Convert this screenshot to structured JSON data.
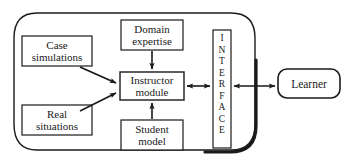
{
  "diagram": {
    "colors": {
      "stroke": "#1a1a1a",
      "box_fill": "#ffffff",
      "background": "#ffffff",
      "text": "#1a1a1a"
    },
    "container": {
      "name": "system-boundary",
      "shape": "rounded-rectangle"
    },
    "nodes": [
      {
        "id": "case-simulations",
        "lines": [
          "Case",
          "simulations"
        ],
        "shape": "rectangle"
      },
      {
        "id": "real-situations",
        "lines": [
          "Real",
          "situations"
        ],
        "shape": "rectangle"
      },
      {
        "id": "domain-expertise",
        "lines": [
          "Domain",
          "expertise"
        ],
        "shape": "rectangle"
      },
      {
        "id": "instructor-module",
        "lines": [
          "Instructor",
          "module"
        ],
        "shape": "rectangle"
      },
      {
        "id": "student-model",
        "lines": [
          "Student",
          "model"
        ],
        "shape": "rectangle"
      },
      {
        "id": "interface",
        "lines": [
          "I",
          "N",
          "T",
          "E",
          "R",
          "F",
          "A",
          "C",
          "E"
        ],
        "shape": "rectangle-vertical-text"
      },
      {
        "id": "learner",
        "lines": [
          "Learner"
        ],
        "shape": "rounded-rectangle"
      }
    ],
    "edges": [
      {
        "id": "case-simulations-to-instructor-module",
        "from": "case-simulations",
        "to": "instructor-module",
        "arrow": "single"
      },
      {
        "id": "real-situations-to-instructor-module",
        "from": "real-situations",
        "to": "instructor-module",
        "arrow": "single"
      },
      {
        "id": "domain-expertise-to-instructor-module",
        "from": "domain-expertise",
        "to": "instructor-module",
        "arrow": "single"
      },
      {
        "id": "student-model-to-instructor-module",
        "from": "student-model",
        "to": "instructor-module",
        "arrow": "single"
      },
      {
        "id": "instructor-module-to-interface",
        "from": "instructor-module",
        "to": "interface",
        "arrow": "double"
      },
      {
        "id": "interface-to-learner",
        "from": "interface",
        "to": "learner",
        "arrow": "double"
      }
    ]
  }
}
